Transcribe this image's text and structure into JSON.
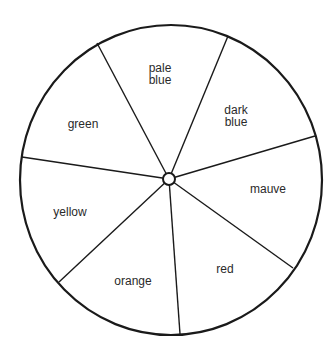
{
  "diagram": {
    "type": "colour wheel",
    "center": [
      169,
      179
    ],
    "radius": [
      152,
      155
    ],
    "spokes": [
      [
        97,
        43
      ],
      [
        228,
        36
      ],
      [
        315,
        136
      ],
      [
        293,
        268
      ],
      [
        180,
        334
      ],
      [
        59,
        282
      ],
      [
        22,
        157
      ]
    ],
    "segments": [
      {
        "label": "pale\nblue",
        "pos": [
          160,
          74
        ]
      },
      {
        "label": "dark\nblue",
        "pos": [
          236,
          116
        ]
      },
      {
        "label": "mauve",
        "pos": [
          268,
          189
        ]
      },
      {
        "label": "red",
        "pos": [
          225,
          269
        ]
      },
      {
        "label": "orange",
        "pos": [
          133,
          281
        ]
      },
      {
        "label": "yellow",
        "pos": [
          70,
          212
        ]
      },
      {
        "label": "green",
        "pos": [
          83,
          124
        ]
      }
    ]
  }
}
